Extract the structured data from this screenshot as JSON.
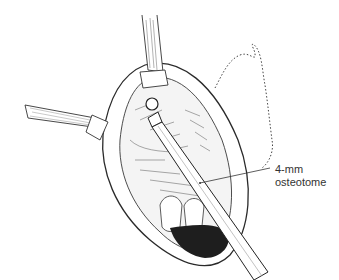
{
  "figure": {
    "type": "surgical illustration",
    "annotation": {
      "line1": "4-mm",
      "line2": "osteotome"
    },
    "colors": {
      "ink": "#2a2a2a",
      "background": "#ffffff",
      "dark_cavity": "#1e1e1e"
    }
  }
}
